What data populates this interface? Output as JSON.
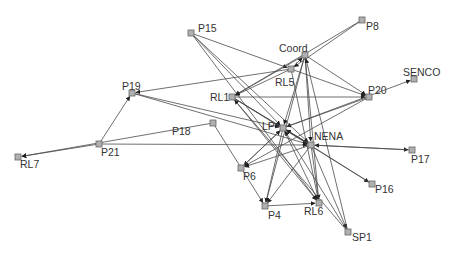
{
  "diagram": {
    "type": "directed network graph",
    "edge_color": "#4a4a4a",
    "node_fill": "#b0b0b0",
    "node_stroke": "#666666",
    "arrow_color": "#222222",
    "nodes": [
      {
        "id": "P15",
        "label": "P15",
        "x": 191,
        "y": 33,
        "lx": 198,
        "ly": 23,
        "anchor": "left"
      },
      {
        "id": "P8",
        "label": "P8",
        "x": 362,
        "y": 20,
        "lx": 366,
        "ly": 21,
        "anchor": "left"
      },
      {
        "id": "Coord",
        "label": "Coord",
        "x": 305,
        "y": 55,
        "lx": 279,
        "ly": 43,
        "anchor": "left"
      },
      {
        "id": "RL5",
        "label": "RL5",
        "x": 291,
        "y": 69,
        "lx": 275,
        "ly": 77,
        "anchor": "left"
      },
      {
        "id": "SENCO",
        "label": "SENCO",
        "x": 414,
        "y": 79,
        "lx": 403,
        "ly": 67,
        "anchor": "left"
      },
      {
        "id": "P20",
        "label": "P20",
        "x": 369,
        "y": 97,
        "lx": 368,
        "ly": 85,
        "anchor": "left"
      },
      {
        "id": "P19",
        "label": "P19",
        "x": 132,
        "y": 93,
        "lx": 122,
        "ly": 81,
        "anchor": "left"
      },
      {
        "id": "RL1",
        "label": "RL1",
        "x": 232,
        "y": 97,
        "lx": 210,
        "ly": 92,
        "anchor": "left"
      },
      {
        "id": "P18",
        "label": "P18",
        "x": 213,
        "y": 123,
        "lx": 172,
        "ly": 126,
        "anchor": "left"
      },
      {
        "id": "P21",
        "label": "P21",
        "x": 99,
        "y": 144,
        "lx": 101,
        "ly": 147,
        "anchor": "left"
      },
      {
        "id": "RL7",
        "label": "RL7",
        "x": 18,
        "y": 157,
        "lx": 20,
        "ly": 159,
        "anchor": "left"
      },
      {
        "id": "LP",
        "label": "LP",
        "x": 283,
        "y": 128,
        "lx": 262,
        "ly": 121,
        "anchor": "left"
      },
      {
        "id": "NENA",
        "label": "NENA",
        "x": 311,
        "y": 145,
        "lx": 314,
        "ly": 131,
        "anchor": "left"
      },
      {
        "id": "P17",
        "label": "P17",
        "x": 412,
        "y": 150,
        "lx": 411,
        "ly": 154,
        "anchor": "left"
      },
      {
        "id": "P6",
        "label": "P6",
        "x": 241,
        "y": 168,
        "lx": 243,
        "ly": 171,
        "anchor": "left"
      },
      {
        "id": "P16",
        "label": "P16",
        "x": 372,
        "y": 184,
        "lx": 375,
        "ly": 184,
        "anchor": "left"
      },
      {
        "id": "P4",
        "label": "P4",
        "x": 265,
        "y": 206,
        "lx": 268,
        "ly": 210,
        "anchor": "left"
      },
      {
        "id": "RL6",
        "label": "RL6",
        "x": 319,
        "y": 203,
        "lx": 304,
        "ly": 206,
        "anchor": "left"
      },
      {
        "id": "SP1",
        "label": "SP1",
        "x": 348,
        "y": 232,
        "lx": 352,
        "ly": 232,
        "anchor": "left"
      }
    ],
    "edges": [
      {
        "from": "P15",
        "to": "RL5"
      },
      {
        "from": "P15",
        "to": "LP"
      },
      {
        "from": "P15",
        "to": "NENA"
      },
      {
        "from": "P15",
        "to": "RL6"
      },
      {
        "from": "P8",
        "to": "RL1"
      },
      {
        "from": "P8",
        "to": "RL5"
      },
      {
        "from": "Coord",
        "to": "RL1"
      },
      {
        "from": "Coord",
        "to": "P20"
      },
      {
        "from": "Coord",
        "to": "LP"
      },
      {
        "from": "Coord",
        "to": "NENA"
      },
      {
        "from": "Coord",
        "to": "RL6"
      },
      {
        "from": "Coord",
        "to": "P4"
      },
      {
        "from": "RL5",
        "to": "Coord"
      },
      {
        "from": "RL5",
        "to": "P19"
      },
      {
        "from": "RL5",
        "to": "P20"
      },
      {
        "from": "RL5",
        "to": "RL1"
      },
      {
        "from": "RL5",
        "to": "RL6"
      },
      {
        "from": "RL1",
        "to": "P20"
      },
      {
        "from": "RL1",
        "to": "LP"
      },
      {
        "from": "RL1",
        "to": "NENA"
      },
      {
        "from": "RL1",
        "to": "RL6"
      },
      {
        "from": "RL1",
        "to": "P16"
      },
      {
        "from": "P20",
        "to": "P6"
      },
      {
        "from": "P20",
        "to": "LP"
      },
      {
        "from": "P19",
        "to": "LP"
      },
      {
        "from": "P19",
        "to": "NENA"
      },
      {
        "from": "P18",
        "to": "RL7"
      },
      {
        "from": "P18",
        "to": "P4"
      },
      {
        "from": "P21",
        "to": "RL7"
      },
      {
        "from": "P21",
        "to": "P19"
      },
      {
        "from": "P21",
        "to": "NENA"
      },
      {
        "from": "LP",
        "to": "NENA"
      },
      {
        "from": "LP",
        "to": "RL6"
      },
      {
        "from": "LP",
        "to": "SENCO"
      },
      {
        "from": "LP",
        "to": "P4"
      },
      {
        "from": "LP",
        "to": "P6"
      },
      {
        "from": "NENA",
        "to": "LP"
      },
      {
        "from": "NENA",
        "to": "P17"
      },
      {
        "from": "NENA",
        "to": "RL6"
      },
      {
        "from": "NENA",
        "to": "SP1"
      },
      {
        "from": "NENA",
        "to": "P4"
      },
      {
        "from": "NENA",
        "to": "P6"
      },
      {
        "from": "P6",
        "to": "LP"
      },
      {
        "from": "P16",
        "to": "LP"
      },
      {
        "from": "P4",
        "to": "RL6"
      },
      {
        "from": "SP1",
        "to": "LP"
      },
      {
        "from": "SP1",
        "to": "RL1"
      },
      {
        "from": "P17",
        "to": "NENA"
      },
      {
        "from": "SP1",
        "to": "Coord"
      }
    ]
  }
}
